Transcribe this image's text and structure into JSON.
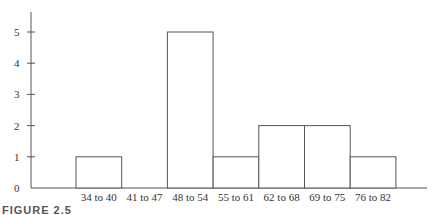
{
  "chart_data": {
    "type": "bar",
    "subtype": "histogram",
    "title": "",
    "xlabel": "",
    "ylabel": "",
    "categories": [
      "34 to 40",
      "41 to 47",
      "48 to 54",
      "55 to 61",
      "62 to 68",
      "69 to 75",
      "76 to 82"
    ],
    "values": [
      1,
      0,
      5,
      1,
      2,
      2,
      1
    ],
    "ylim": [
      0,
      5
    ],
    "yticks": [
      0,
      1,
      2,
      3,
      4,
      5
    ],
    "grid": false,
    "legend": null,
    "bar_fill": "#ffffff",
    "bar_stroke": "#555555"
  },
  "caption": "FIGURE 2.5"
}
